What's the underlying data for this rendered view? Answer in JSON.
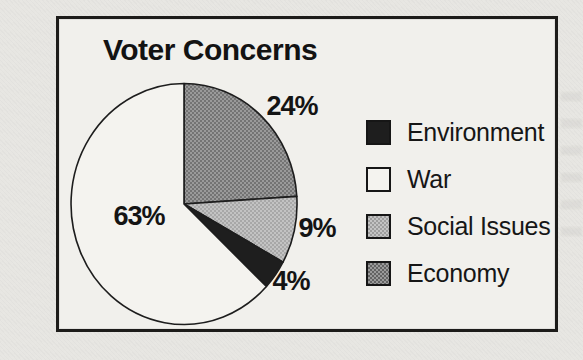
{
  "chart_data": {
    "type": "pie",
    "title": "Voter Concerns",
    "legend_position": "right",
    "start_angle_deg": 0,
    "direction": "clockwise",
    "draw_order": [
      "Economy",
      "Social Issues",
      "Environment",
      "War"
    ],
    "slices": [
      {
        "label": "Environment",
        "value": 4,
        "pct_label": "4%",
        "fill": {
          "type": "solid",
          "color": "#1e1e1e"
        }
      },
      {
        "label": "War",
        "value": 63,
        "pct_label": "63%",
        "fill": {
          "type": "solid",
          "color": "#f4f3ef"
        }
      },
      {
        "label": "Social Issues",
        "value": 9,
        "pct_label": "9%",
        "fill": {
          "type": "halftone",
          "base": "#c3c3c3",
          "dot": "#9d9d9d"
        }
      },
      {
        "label": "Economy",
        "value": 24,
        "pct_label": "24%",
        "fill": {
          "type": "halftone",
          "base": "#9a9a9a",
          "dot": "#636363"
        }
      }
    ],
    "frame_border_color": "#1d1c1a",
    "paper_color": "#e7e6e2",
    "panel_color": "#f1f0ec",
    "text_color": "#141414"
  }
}
